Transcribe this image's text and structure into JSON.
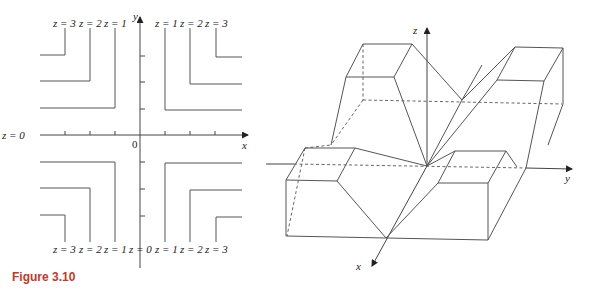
{
  "caption": "Figure 3.10",
  "contour_plot": {
    "x_axis_label": "x",
    "y_axis_label": "y",
    "origin_label": "0",
    "left_axis_label": "z = 0",
    "top_labels_left": [
      "z = 3",
      "z = 2",
      "z = 1"
    ],
    "top_labels_right": [
      "z = 1",
      "z = 2",
      "z = 3"
    ],
    "bottom_labels": [
      "z = 3",
      "z = 2",
      "z = 1",
      "z = 0",
      "z = 1",
      "z = 2",
      "z = 3"
    ]
  },
  "surface_plot": {
    "x_axis_label": "x",
    "y_axis_label": "y",
    "z_axis_label": "z"
  }
}
